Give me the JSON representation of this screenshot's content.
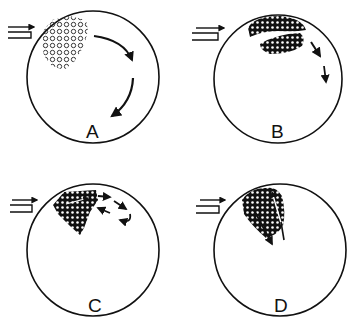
{
  "figure": {
    "ink_color": "#111111",
    "background": "#ffffff",
    "flow_symbol": "double-arrow-inlet",
    "panels": [
      {
        "id": "A",
        "label": "A",
        "cluster": "loose-circles",
        "arrows": "two curved clockwise arrows"
      },
      {
        "id": "B",
        "label": "B",
        "cluster": "split-two-lobes",
        "arrows": "two short downward arrows"
      },
      {
        "id": "C",
        "label": "C",
        "cluster": "dense-triangle",
        "arrows": "rightward, return and curl arrows"
      },
      {
        "id": "D",
        "label": "D",
        "cluster": "dense-leaf",
        "arrows": "downward and upward internal arrows"
      }
    ]
  }
}
